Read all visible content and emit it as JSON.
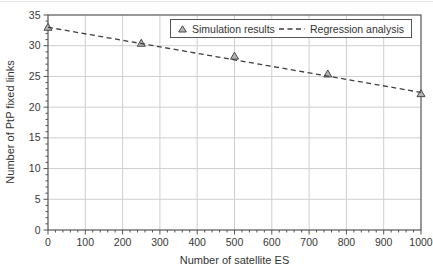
{
  "chart_data": {
    "type": "scatter",
    "title": "",
    "xlabel": "Number of satellite ES",
    "ylabel": "Number of PtP fixed links",
    "xlim": [
      0,
      1000
    ],
    "ylim": [
      0,
      35
    ],
    "xticks": [
      0,
      100,
      200,
      300,
      400,
      500,
      600,
      700,
      800,
      900,
      1000
    ],
    "yticks": [
      0,
      5,
      10,
      15,
      20,
      25,
      30,
      35
    ],
    "x_minor_step": 20,
    "y_minor_step": 1,
    "grid": true,
    "legend_position": "top-center-inside",
    "series": [
      {
        "name": "Simulation results",
        "kind": "scatter",
        "marker": "triangle",
        "x": [
          0,
          250,
          500,
          750,
          1000
        ],
        "y": [
          33.0,
          30.4,
          28.3,
          25.4,
          22.2
        ]
      },
      {
        "name": "Regression analysis",
        "kind": "line",
        "style": "dashed",
        "x": [
          0,
          1000
        ],
        "y": [
          33.0,
          22.4
        ]
      }
    ],
    "legend": [
      {
        "marker": "triangle",
        "label": "Simulation results"
      },
      {
        "marker": "dashed-line",
        "label": "Regression analysis"
      }
    ],
    "colors": {
      "grid": "#cfcfcf",
      "axis": "#555555",
      "text": "#383838",
      "marker_fill": "#b4b4b4",
      "marker_stroke": "#4a4a4a",
      "line": "#3f3f3f"
    }
  }
}
